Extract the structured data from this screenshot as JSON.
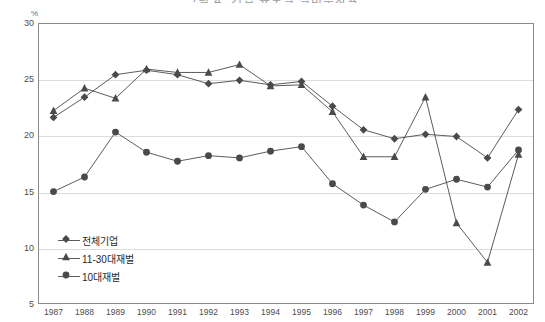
{
  "chart_data": {
    "type": "line",
    "title": "그림 4. 기업 규모별 설비투자율",
    "unit_label": "%",
    "xlabel": "",
    "ylabel": "",
    "x": [
      1987,
      1988,
      1989,
      1990,
      1991,
      1992,
      1993,
      1994,
      1995,
      1996,
      1997,
      1998,
      1999,
      2000,
      2001,
      2002
    ],
    "xtick_labels": [
      "1987",
      "1988",
      "1989",
      "1990",
      "1991",
      "1992",
      "1993",
      "1994",
      "1995",
      "1996",
      "1997",
      "1998",
      "1999",
      "2000",
      "2001",
      "2002"
    ],
    "ylim": [
      5,
      30
    ],
    "ytick_labels": [
      "5",
      "10",
      "15",
      "20",
      "25",
      "30"
    ],
    "yticks": [
      5,
      10,
      15,
      20,
      25,
      30
    ],
    "grid": true,
    "legend_position": "inside-lower-left",
    "series": [
      {
        "name": "전체기업",
        "marker": "diamond",
        "color": "#4a4a4a",
        "values": [
          21.6,
          23.4,
          25.4,
          25.8,
          25.4,
          24.6,
          24.9,
          24.5,
          24.8,
          22.6,
          20.5,
          19.7,
          20.1,
          19.9,
          18.0,
          22.3
        ]
      },
      {
        "name": "11-30대재벌",
        "marker": "triangle",
        "color": "#4a4a4a",
        "values": [
          22.2,
          24.2,
          23.3,
          25.9,
          25.6,
          25.6,
          26.3,
          24.4,
          24.5,
          22.1,
          18.1,
          18.1,
          23.4,
          12.2,
          8.7,
          18.3
        ]
      },
      {
        "name": "10대재벌",
        "marker": "circle",
        "color": "#4a4a4a",
        "values": [
          15.0,
          16.3,
          20.3,
          18.5,
          17.7,
          18.2,
          18.0,
          18.6,
          19.0,
          15.7,
          13.8,
          12.3,
          15.2,
          16.1,
          15.4,
          18.7
        ]
      }
    ]
  },
  "colors": {
    "axis": "#8a8a8a",
    "grid": "#dcdcdc",
    "series": "#4a4a4a",
    "text": "#2a2a2a"
  }
}
